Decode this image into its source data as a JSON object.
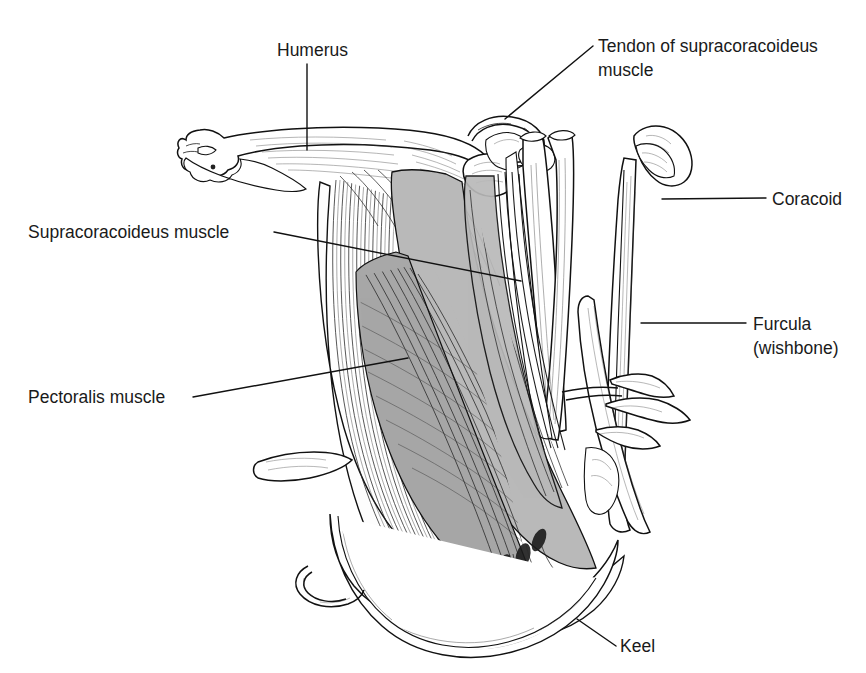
{
  "figure": {
    "background_color": "#ffffff",
    "ink_color": "#111111",
    "muscle_shade_color": "#b9b9b9"
  },
  "labels": {
    "humerus": "Humerus",
    "tendon_line1": "Tendon of supracoracoideus",
    "tendon_line2": "muscle",
    "coracoid": "Coracoid",
    "furcula_line1": "Furcula",
    "furcula_line2": "(wishbone)",
    "supracoracoideus": "Supracoracoideus muscle",
    "pectoralis": "Pectoralis muscle",
    "keel": "Keel"
  }
}
